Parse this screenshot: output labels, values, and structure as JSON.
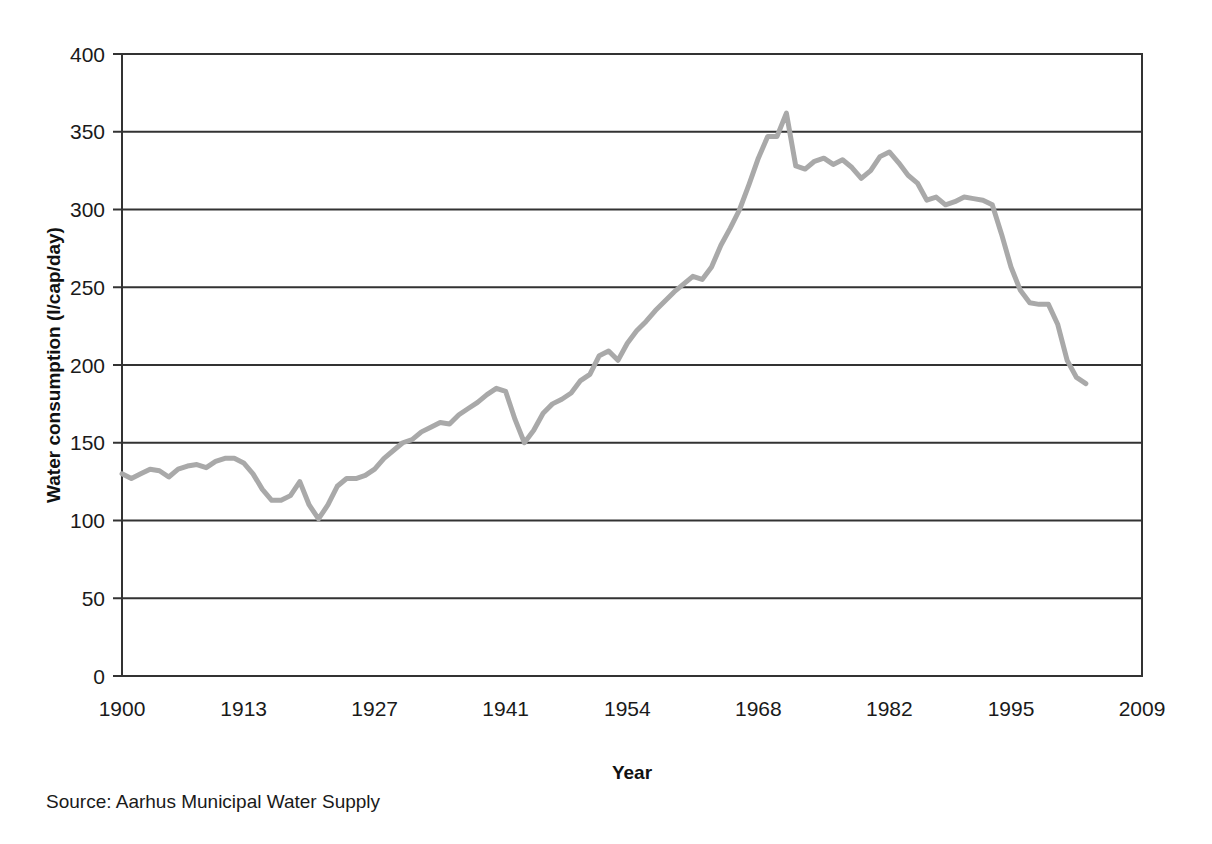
{
  "chart_data": {
    "type": "line",
    "title": "",
    "xlabel": "Year",
    "ylabel": "Water consumption (l/cap/day)",
    "xlim": [
      1900,
      2009
    ],
    "ylim": [
      0,
      400
    ],
    "ytick_values": [
      0,
      50,
      100,
      150,
      200,
      250,
      300,
      350,
      400
    ],
    "ytick_labels": [
      "0",
      "50",
      "100",
      "150",
      "200",
      "250",
      "300",
      "350",
      "400"
    ],
    "xtick_values": [
      1900,
      1913,
      1927,
      1941,
      1954,
      1968,
      1982,
      1995,
      2009
    ],
    "xtick_labels": [
      "1900",
      "1913",
      "1927",
      "1941",
      "1954",
      "1968",
      "1982",
      "1995",
      "2009"
    ],
    "grid": "horizontal",
    "legend": "none",
    "line_color": "#a9a9a9",
    "axis_color": "#333333",
    "series": [
      {
        "name": "Water consumption",
        "x": [
          1900,
          1901,
          1902,
          1903,
          1904,
          1905,
          1906,
          1907,
          1908,
          1909,
          1910,
          1911,
          1912,
          1913,
          1914,
          1915,
          1916,
          1917,
          1918,
          1919,
          1920,
          1921,
          1922,
          1923,
          1924,
          1925,
          1926,
          1927,
          1928,
          1929,
          1930,
          1931,
          1932,
          1933,
          1934,
          1935,
          1936,
          1937,
          1938,
          1939,
          1940,
          1941,
          1942,
          1943,
          1944,
          1945,
          1946,
          1947,
          1948,
          1949,
          1950,
          1951,
          1952,
          1953,
          1954,
          1955,
          1956,
          1957,
          1958,
          1959,
          1960,
          1961,
          1962,
          1963,
          1964,
          1965,
          1966,
          1967,
          1968,
          1969,
          1970,
          1971,
          1972,
          1973,
          1974,
          1975,
          1976,
          1977,
          1978,
          1979,
          1980,
          1981,
          1982,
          1983,
          1984,
          1985,
          1986,
          1987,
          1988,
          1989,
          1990,
          1991,
          1992,
          1993,
          1994,
          1995,
          1996,
          1997,
          1998,
          1999,
          2000,
          2001,
          2002,
          2003
        ],
        "values": [
          130,
          127,
          130,
          133,
          132,
          128,
          133,
          135,
          136,
          134,
          138,
          140,
          140,
          137,
          130,
          120,
          113,
          113,
          116,
          125,
          110,
          101,
          110,
          122,
          127,
          127,
          129,
          133,
          140,
          145,
          150,
          152,
          157,
          160,
          163,
          162,
          168,
          172,
          176,
          181,
          185,
          183,
          165,
          150,
          158,
          169,
          175,
          178,
          182,
          190,
          194,
          206,
          209,
          203,
          214,
          222,
          228,
          235,
          241,
          247,
          252,
          257,
          255,
          263,
          277,
          288,
          300,
          316,
          333,
          347,
          347,
          362,
          328,
          326,
          331,
          333,
          329,
          332,
          327,
          320,
          325,
          334,
          337,
          330,
          322,
          317,
          306,
          308,
          303,
          305,
          308,
          307,
          306,
          303,
          284,
          263,
          248,
          240,
          239,
          239,
          226,
          203,
          192,
          188
        ]
      }
    ],
    "source_note": "Source: Aarhus Municipal Water Supply"
  }
}
